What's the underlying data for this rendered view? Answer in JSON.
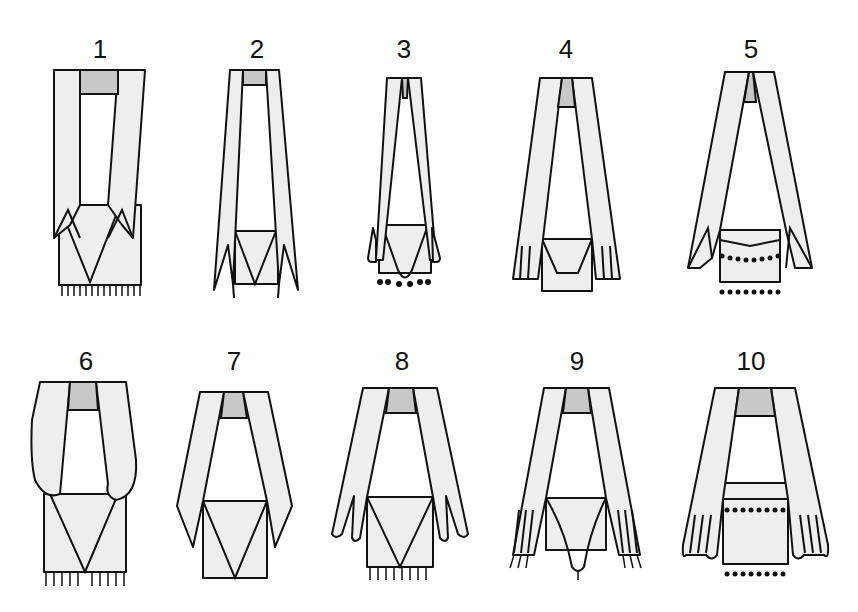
{
  "diagram": {
    "colors": {
      "fabric": "#eeeeee",
      "knot": "#c8c8c8",
      "outline": "#111111",
      "background": "#ffffff"
    },
    "figures": [
      {
        "id": 1,
        "label": "1"
      },
      {
        "id": 2,
        "label": "2"
      },
      {
        "id": 3,
        "label": "3"
      },
      {
        "id": 4,
        "label": "4"
      },
      {
        "id": 5,
        "label": "5"
      },
      {
        "id": 6,
        "label": "6"
      },
      {
        "id": 7,
        "label": "7"
      },
      {
        "id": 8,
        "label": "8"
      },
      {
        "id": 9,
        "label": "9"
      },
      {
        "id": 10,
        "label": "10"
      }
    ]
  }
}
